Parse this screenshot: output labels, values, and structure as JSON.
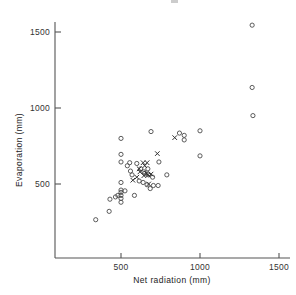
{
  "figure": {
    "background_color": "#ffffff",
    "axis_color": "#555555",
    "marker_color": "#4a4a4a",
    "cross_color": "#333333"
  },
  "chart_data": {
    "type": "scatter",
    "title": "",
    "xlabel": "Net  radiation (mm)",
    "ylabel": "Evaporation (mm)",
    "xlim": [
      83,
      1560
    ],
    "ylim": [
      0,
      1600
    ],
    "xticks": [
      500,
      1000,
      1500
    ],
    "xticklabels": [
      "500",
      "1000",
      "1500"
    ],
    "yticks": [
      500,
      1000,
      1500
    ],
    "yticklabels": [
      "500",
      "1000",
      "1500"
    ],
    "grid": false,
    "legend": "none",
    "series": [
      {
        "name": "open-circle",
        "marker": "o",
        "points": [
          [
            340,
            265
          ],
          [
            425,
            320
          ],
          [
            430,
            400
          ],
          [
            465,
            415
          ],
          [
            480,
            425
          ],
          [
            500,
            380
          ],
          [
            500,
            405
          ],
          [
            500,
            425
          ],
          [
            500,
            445
          ],
          [
            500,
            460
          ],
          [
            500,
            510
          ],
          [
            500,
            645
          ],
          [
            500,
            695
          ],
          [
            500,
            800
          ],
          [
            525,
            455
          ],
          [
            540,
            620
          ],
          [
            555,
            640
          ],
          [
            560,
            585
          ],
          [
            570,
            560
          ],
          [
            585,
            425
          ],
          [
            600,
            635
          ],
          [
            615,
            520
          ],
          [
            625,
            600
          ],
          [
            640,
            510
          ],
          [
            645,
            580
          ],
          [
            650,
            570
          ],
          [
            665,
            495
          ],
          [
            670,
            600
          ],
          [
            675,
            560
          ],
          [
            685,
            470
          ],
          [
            690,
            845
          ],
          [
            700,
            545
          ],
          [
            705,
            490
          ],
          [
            735,
            490
          ],
          [
            740,
            645
          ],
          [
            790,
            560
          ],
          [
            870,
            835
          ],
          [
            900,
            820
          ],
          [
            900,
            790
          ],
          [
            1000,
            850
          ],
          [
            1000,
            685
          ],
          [
            1330,
            1545
          ],
          [
            1330,
            1135
          ],
          [
            1335,
            950
          ]
        ]
      },
      {
        "name": "cross",
        "marker": "x",
        "points": [
          [
            575,
            525
          ],
          [
            600,
            545
          ],
          [
            615,
            600
          ],
          [
            620,
            580
          ],
          [
            640,
            640
          ],
          [
            645,
            555
          ],
          [
            650,
            620
          ],
          [
            660,
            570
          ],
          [
            665,
            640
          ],
          [
            670,
            560
          ],
          [
            675,
            500
          ],
          [
            690,
            565
          ],
          [
            730,
            700
          ],
          [
            840,
            805
          ]
        ]
      }
    ]
  }
}
